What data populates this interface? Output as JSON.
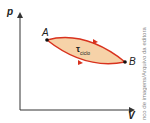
{
  "diagram": {
    "type": "pV-cycle",
    "axes": {
      "y_label": "p",
      "x_label": "V"
    },
    "points": [
      {
        "label": "A"
      },
      {
        "label": "B"
      }
    ],
    "area_label": {
      "symbol": "τ",
      "subscript": "ciclo"
    },
    "colors": {
      "curve": "#d8321e",
      "fill": "#f6d2a8",
      "axis": "#333333"
    }
  },
  "credit": "nco de imagens/Arquivo da editora"
}
